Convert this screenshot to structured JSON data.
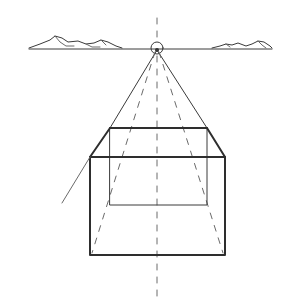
{
  "drawing": {
    "title": "",
    "subject": "one-point perspective box sketch",
    "colors": {
      "background": "#ffffff",
      "pencil": "#3a3a3a",
      "light_pencil": "#6a6a6a"
    },
    "horizon": {
      "y": 49,
      "x1": 29,
      "x2": 272
    },
    "vanishing_point": {
      "x": 157,
      "y": 49,
      "r": 6
    },
    "center_axis": {
      "x": 157,
      "y1": 18,
      "y2": 300
    },
    "back_face": {
      "x1": 110,
      "y1": 128,
      "x2": 207,
      "y2": 205
    },
    "front_face": {
      "x1": 90,
      "y1": 157,
      "x2": 225,
      "y2": 255
    },
    "guide_line": {
      "x1": 62,
      "y1": 203,
      "x2": 90,
      "y2": 157
    },
    "mountains_left": "M29,48 L40,44 L50,40 L55,36 L62,38 L68,42 L78,41 L86,44 L94,43 L101,40 L108,42 L116,46 L122,48",
    "mountains_right": "M212,48 L220,46 L226,44 L232,45 L238,43 L246,46 L252,44 L258,41 L264,42 L270,46 L272,48"
  }
}
